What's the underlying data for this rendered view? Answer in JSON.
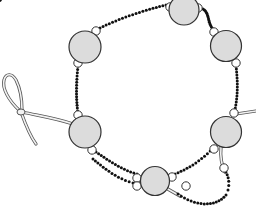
{
  "illustration": {
    "subject": "Beaded bracelet with knotted cord loop clasp",
    "colors": {
      "background": "#ffffff",
      "big_bead_fill": "#dcdcdc",
      "big_bead_stroke": "#333333",
      "spacer_fill": "#ffffff",
      "spacer_stroke": "#333333",
      "seed_bead": "#111111",
      "cord_fill": "#f2f2f2",
      "cord_stroke": "#555555"
    },
    "big_beads": [
      {
        "name": "big-bead-top"
      },
      {
        "name": "big-bead-upper-left"
      },
      {
        "name": "big-bead-upper-right"
      },
      {
        "name": "big-bead-lower-left"
      },
      {
        "name": "big-bead-lower-right"
      },
      {
        "name": "big-bead-bottom"
      }
    ],
    "seed_strands": [
      {
        "name": "seed-strand-top-left"
      },
      {
        "name": "seed-strand-top-right"
      },
      {
        "name": "seed-strand-left"
      },
      {
        "name": "seed-strand-right"
      },
      {
        "name": "seed-strand-lower-left-outer"
      },
      {
        "name": "seed-strand-lower-left-inner"
      },
      {
        "name": "seed-strand-lower-right"
      },
      {
        "name": "seed-strand-tail"
      }
    ]
  }
}
